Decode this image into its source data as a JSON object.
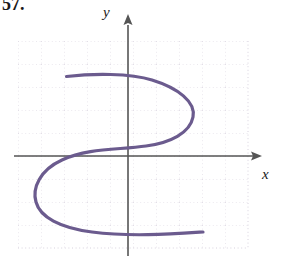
{
  "figure": {
    "problem_number": "57.",
    "background_color": "#ffffff"
  },
  "axes": {
    "x_label": "x",
    "y_label": "y",
    "axis_color": "#555555",
    "x_axis_y_px": 156,
    "y_axis_x_px": 128,
    "x_arrow_direction": "right",
    "y_arrow_direction": "up"
  },
  "grid": {
    "color": "#d8d2de",
    "style": "dotted",
    "spacing_px": 23,
    "left_px": 18,
    "top_px": 41,
    "right_px": 248,
    "bottom_px": 248,
    "columns": 10,
    "rows": 9
  },
  "chart_data": {
    "type": "line",
    "title": "",
    "xlabel": "x",
    "ylabel": "y",
    "grid": true,
    "legend": null,
    "xlim": [
      -4.8,
      5.2
    ],
    "ylim": [
      -4.0,
      5.0
    ],
    "series": [
      {
        "name": "curve",
        "color": "#6b5b8e",
        "closed": false,
        "points": [
          [
            -2.7,
            3.5
          ],
          [
            -1.6,
            3.6
          ],
          [
            -0.5,
            3.5
          ],
          [
            0.6,
            3.1
          ],
          [
            1.9,
            2.4
          ],
          [
            2.7,
            1.4
          ],
          [
            2.7,
            0.4
          ],
          [
            2.0,
            -0.2
          ],
          [
            0.9,
            -0.4
          ],
          [
            -0.5,
            -0.4
          ],
          [
            -1.9,
            -0.6
          ],
          [
            -3.2,
            -1.2
          ],
          [
            -4.0,
            -2.1
          ],
          [
            -4.0,
            -3.0
          ],
          [
            -3.2,
            -3.7
          ],
          [
            -2.0,
            -4.0
          ],
          [
            -0.6,
            -4.1
          ],
          [
            1.0,
            -4.0
          ],
          [
            2.3,
            -3.5
          ],
          [
            3.3,
            -3.3
          ]
        ]
      }
    ]
  },
  "curve_geometry": {
    "stroke_color": "#6b5b8e",
    "stroke_width_px": 3.2,
    "path": "M 66.5,76.5 C 92,73.5 130,73 152,80 C 178,88 196,102 193,117 C 190,133 170,143 146,146 C 118,150 88,148 62,160 C 40,170 32,188 36,202 C 40,217 60,228 92,232 C 130,237 172,234 203,232"
  }
}
